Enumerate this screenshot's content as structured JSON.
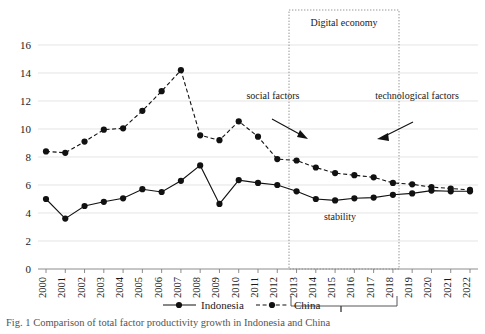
{
  "chart_data": {
    "type": "line",
    "title": "",
    "xlabel": "",
    "ylabel": "",
    "ylim": [
      0,
      16
    ],
    "ytick_step": 2,
    "grid": true,
    "legend_position": "bottom",
    "categories": [
      "2000",
      "2001",
      "2002",
      "2003",
      "2004",
      "2005",
      "2006",
      "2007",
      "2008",
      "2009",
      "2010",
      "2011",
      "2012",
      "2013",
      "2014",
      "2015",
      "2016",
      "2017",
      "2018",
      "2019",
      "2020",
      "2021",
      "2022"
    ],
    "yticks": [
      "0",
      "2",
      "4",
      "6",
      "8",
      "10",
      "12",
      "14",
      "16"
    ],
    "series": [
      {
        "name": "Indonesia",
        "style": "solid",
        "values": [
          5.0,
          3.6,
          4.5,
          4.8,
          5.05,
          5.7,
          5.5,
          6.3,
          7.4,
          4.65,
          6.35,
          6.15,
          6.0,
          5.55,
          5.0,
          4.9,
          5.05,
          5.1,
          5.3,
          5.4,
          5.6,
          5.55,
          5.55
        ]
      },
      {
        "name": "China",
        "style": "dashed",
        "values": [
          8.4,
          8.3,
          9.1,
          9.95,
          10.05,
          11.3,
          12.7,
          14.2,
          9.55,
          9.2,
          10.55,
          9.45,
          7.85,
          7.75,
          7.25,
          6.85,
          6.7,
          6.55,
          6.15,
          6.05,
          5.85,
          5.75,
          5.65
        ]
      }
    ],
    "annotations": [
      {
        "id": "digital-economy",
        "text": "Digital economy"
      },
      {
        "id": "social-factors",
        "text": "social factors"
      },
      {
        "id": "technological-factors",
        "text": "technological factors"
      },
      {
        "id": "stability",
        "text": "stability"
      }
    ],
    "region": {
      "label": "Digital economy",
      "start": "2013",
      "end": "2019"
    }
  },
  "legend": {
    "items": [
      {
        "label": "Indonesia",
        "style": "solid"
      },
      {
        "label": "China",
        "style": "dashed"
      }
    ]
  },
  "caption": {
    "text": "Fig. 1   Comparison of total factor productivity growth in Indonesia and China"
  }
}
